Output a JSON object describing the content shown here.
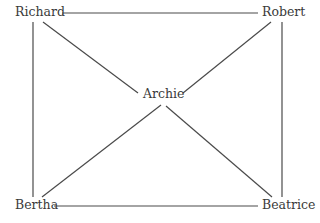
{
  "diagram": {
    "type": "network-graph",
    "nodes": [
      {
        "id": "richard",
        "label": "Richard"
      },
      {
        "id": "robert",
        "label": "Robert"
      },
      {
        "id": "archie",
        "label": "Archie"
      },
      {
        "id": "bertha",
        "label": "Bertha"
      },
      {
        "id": "beatrice",
        "label": "Beatrice"
      }
    ],
    "edges": [
      {
        "from": "Richard",
        "to": "Robert"
      },
      {
        "from": "Richard",
        "to": "Bertha"
      },
      {
        "from": "Richard",
        "to": "Archie"
      },
      {
        "from": "Robert",
        "to": "Beatrice"
      },
      {
        "from": "Robert",
        "to": "Archie"
      },
      {
        "from": "Bertha",
        "to": "Beatrice"
      },
      {
        "from": "Bertha",
        "to": "Archie"
      },
      {
        "from": "Beatrice",
        "to": "Archie"
      }
    ],
    "colors": {
      "line": "#4a4a4a",
      "text": "#3a3a3a",
      "background": "#ffffff"
    }
  }
}
